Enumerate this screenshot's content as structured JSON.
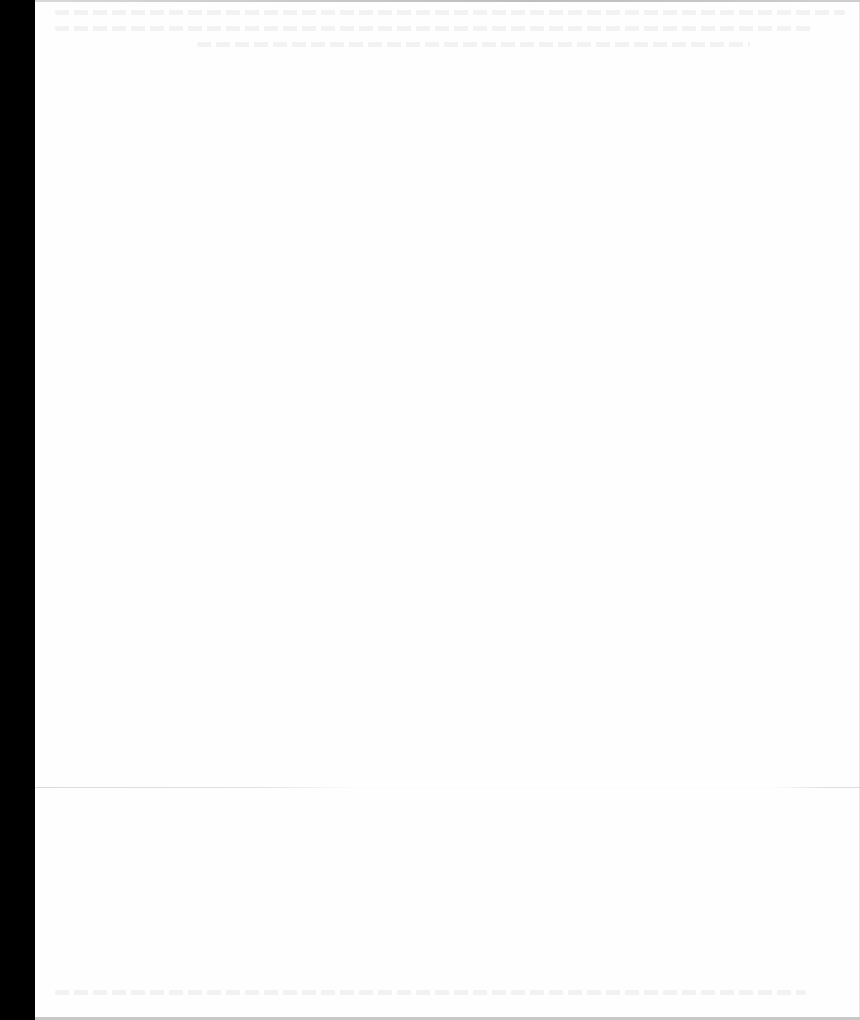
{
  "document": {
    "type": "scanned-page",
    "content_state": "blank",
    "visible_text": [],
    "colors": {
      "scanner_margin": "#000000",
      "paper": "#fefefe",
      "page_edge": "#c8c8c8",
      "bleed_through": "#e6e6e6"
    },
    "layout": {
      "scanner_margin_width_px": 35,
      "crease_y_px": 787
    }
  }
}
